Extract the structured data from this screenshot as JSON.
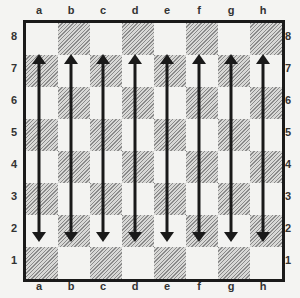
{
  "board": {
    "files": [
      "a",
      "b",
      "c",
      "d",
      "e",
      "f",
      "g",
      "h"
    ],
    "ranks": [
      "8",
      "7",
      "6",
      "5",
      "4",
      "3",
      "2",
      "1"
    ],
    "square_colors": {
      "light": "#f3f3f1",
      "dark": "#a8a8a6"
    },
    "a1_color": "dark"
  },
  "arrows": [
    {
      "file": "a",
      "from_rank": "7",
      "to_rank": "2",
      "type": "double-headed"
    },
    {
      "file": "b",
      "from_rank": "7",
      "to_rank": "2",
      "type": "double-headed"
    },
    {
      "file": "c",
      "from_rank": "7",
      "to_rank": "2",
      "type": "double-headed"
    },
    {
      "file": "d",
      "from_rank": "7",
      "to_rank": "2",
      "type": "double-headed"
    },
    {
      "file": "e",
      "from_rank": "7",
      "to_rank": "2",
      "type": "double-headed"
    },
    {
      "file": "f",
      "from_rank": "7",
      "to_rank": "2",
      "type": "double-headed"
    },
    {
      "file": "g",
      "from_rank": "7",
      "to_rank": "2",
      "type": "double-headed"
    },
    {
      "file": "h",
      "from_rank": "7",
      "to_rank": "2",
      "type": "double-headed"
    }
  ],
  "arrow_color": "#1a1a1a"
}
